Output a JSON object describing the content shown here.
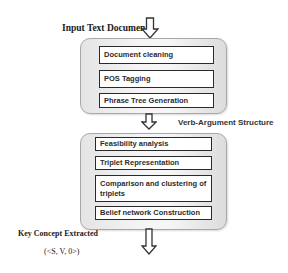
{
  "diagram": {
    "input_label": "Input Text Document",
    "stage1": {
      "steps": [
        {
          "label": "Document cleaning"
        },
        {
          "label": "POS Tagging"
        },
        {
          "label": "Phrase Tree Generation"
        }
      ]
    },
    "intermediate_label": "Verb-Argument Structure",
    "stage2": {
      "steps": [
        {
          "label": "Feasibility analysis"
        },
        {
          "label": "Triplet Representation"
        },
        {
          "label": "Comparison and clustering of triplets"
        },
        {
          "label": "Belief network Construction"
        }
      ]
    },
    "output_label": "Key Concept Extracted",
    "output_format": "(<S, V, 0>)"
  },
  "colors": {
    "container_fill": "#eeeeee",
    "container_border": "#a8a8a8",
    "step_border": "#2a2a2a",
    "arrow_stroke": "#333333"
  }
}
